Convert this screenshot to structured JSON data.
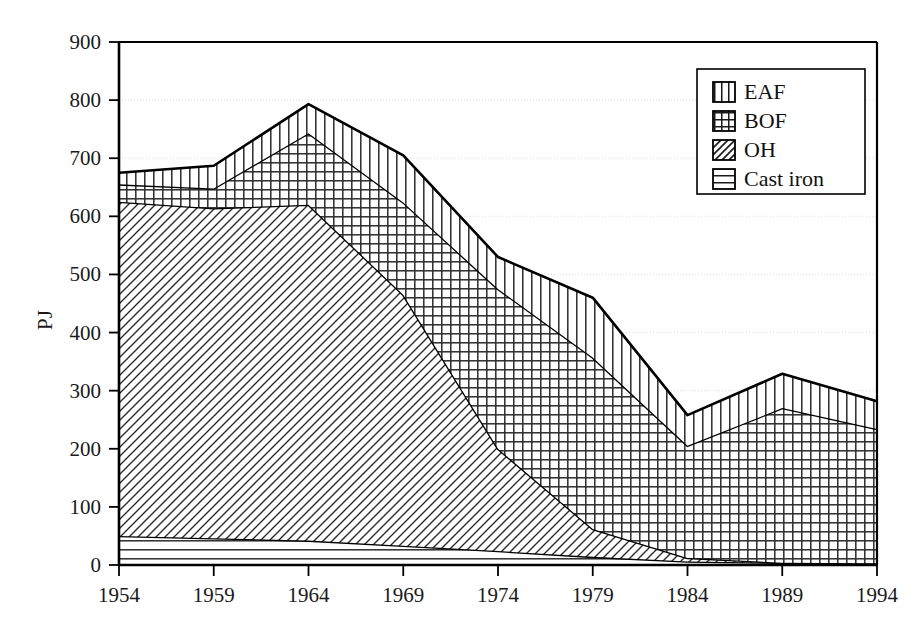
{
  "chart_data": {
    "type": "area",
    "stacked": true,
    "title": "",
    "xlabel": "",
    "ylabel": "PJ",
    "x": [
      1954,
      1959,
      1964,
      1969,
      1974,
      1979,
      1984,
      1989,
      1994
    ],
    "xtick_labels": [
      "1954",
      "1959",
      "1964",
      "1969",
      "1974",
      "1979",
      "1984",
      "1989",
      "1994"
    ],
    "ytick_labels": [
      "0",
      "100",
      "200",
      "300",
      "400",
      "500",
      "600",
      "700",
      "800",
      "900"
    ],
    "yticks": [
      0,
      100,
      200,
      300,
      400,
      500,
      600,
      700,
      800,
      900
    ],
    "ylim": [
      0,
      900
    ],
    "xlim": [
      1954,
      1994
    ],
    "grid": true,
    "legend_position": "top-right",
    "series": [
      {
        "name": "Cast iron",
        "pattern": "horizontal-lines",
        "values": [
          50,
          46,
          42,
          33,
          24,
          14,
          6,
          4,
          3
        ]
      },
      {
        "name": "OH",
        "pattern": "diagonal-lines",
        "values": [
          575,
          568,
          578,
          432,
          176,
          48,
          6,
          0,
          0
        ]
      },
      {
        "name": "BOF",
        "pattern": "grid-crosshatch",
        "values": [
          30,
          34,
          123,
          159,
          275,
          295,
          193,
          266,
          231
        ]
      },
      {
        "name": "EAF",
        "pattern": "vertical-lines",
        "values": [
          20,
          39,
          50,
          81,
          55,
          103,
          53,
          59,
          48
        ]
      }
    ],
    "cumulative_tops": {
      "cast_iron": [
        50,
        46,
        42,
        33,
        24,
        14,
        6,
        4,
        3
      ],
      "oh": [
        625,
        614,
        620,
        465,
        200,
        62,
        12,
        4,
        3
      ],
      "bof": [
        655,
        648,
        743,
        624,
        475,
        357,
        205,
        270,
        234
      ],
      "eaf": [
        675,
        687,
        793,
        705,
        530,
        460,
        258,
        329,
        282
      ]
    },
    "legend_entries": [
      {
        "label": "EAF",
        "pattern": "vertical-lines"
      },
      {
        "label": "BOF",
        "pattern": "grid-crosshatch"
      },
      {
        "label": "OH",
        "pattern": "diagonal-lines"
      },
      {
        "label": "Cast iron",
        "pattern": "horizontal-lines"
      }
    ],
    "colors": {
      "line": "#000000",
      "grid": "#dddddd",
      "background": "#ffffff",
      "hatch": "#2b2b2b"
    }
  }
}
